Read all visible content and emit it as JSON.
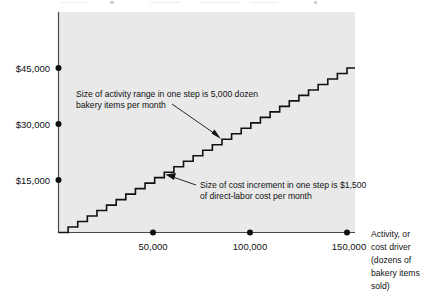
{
  "chart_data": {
    "type": "line",
    "subtype": "step",
    "title": "",
    "xlabel": "Activity, or cost driver (dozens of bakery items sold)",
    "ylabel": "",
    "xlim": [
      0,
      155000
    ],
    "ylim": [
      0,
      52500
    ],
    "grid": false,
    "legend": null,
    "step_width_units": 5000,
    "step_height_dollars": 1500,
    "num_steps": 30,
    "x_ticks": [
      {
        "value": 50000,
        "label": "50,000"
      },
      {
        "value": 100000,
        "label": "100,000"
      },
      {
        "value": 150000,
        "label": "150,000"
      }
    ],
    "y_ticks": [
      {
        "value": 15000,
        "label": "$15,000"
      },
      {
        "value": 30000,
        "label": "$30,000"
      },
      {
        "value": 45000,
        "label": "$45,000"
      }
    ],
    "series": [
      {
        "name": "Step-fixed direct-labor cost",
        "x": [
          0,
          5000,
          10000,
          15000,
          20000,
          25000,
          30000,
          35000,
          40000,
          45000,
          50000,
          55000,
          60000,
          65000,
          70000,
          75000,
          80000,
          85000,
          90000,
          95000,
          100000,
          105000,
          110000,
          115000,
          120000,
          125000,
          130000,
          135000,
          140000,
          145000,
          150000
        ],
        "values": [
          0,
          1500,
          3000,
          4500,
          6000,
          7500,
          9000,
          10500,
          12000,
          13500,
          15000,
          16500,
          18000,
          19500,
          21000,
          22500,
          24000,
          25500,
          27000,
          28500,
          30000,
          31500,
          33000,
          34500,
          36000,
          37500,
          39000,
          40500,
          42000,
          43500,
          45000
        ]
      }
    ],
    "annotations": [
      {
        "id": "activity-range-note",
        "lines": [
          "Size of activity range in one step is 5,000 dozen",
          "bakery items per month"
        ],
        "points_to": {
          "x": 75000,
          "y": 22500
        }
      },
      {
        "id": "cost-increment-note",
        "lines": [
          "Size of cost increment in one step is $1,500",
          "of direct-labor cost per month"
        ],
        "points_to": {
          "x": 45000,
          "y": 14250
        }
      }
    ],
    "axis_title_lines": [
      "Activity, or",
      "cost driver",
      "(dozens of",
      "bakery items",
      "sold)"
    ],
    "colors": {
      "plot_background": "#e9e9e9",
      "axis": "#4a4a4a",
      "step_line": "#111111",
      "text": "#111111",
      "page_background": "#ffffff"
    }
  }
}
